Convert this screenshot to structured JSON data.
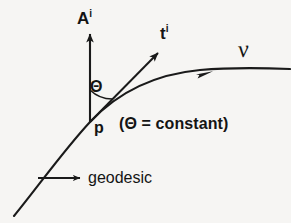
{
  "diagram": {
    "background_color": "#f6f5f3",
    "stroke_color": "#1a1a1a",
    "labels": {
      "acceleration_vector": "A",
      "acceleration_vector_index": "i",
      "tangent_vector": "t",
      "tangent_vector_index": "i",
      "angle": "Θ",
      "point": "p",
      "angle_condition": "(Θ = constant)",
      "curve": "ᴠ",
      "geodesic": "geodesic"
    },
    "elements": [
      {
        "name": "geodesic-curve",
        "type": "curve",
        "description": "concave-down curve passing through p"
      },
      {
        "name": "acceleration-vector-arrow",
        "type": "arrow",
        "direction": "up",
        "from": "p"
      },
      {
        "name": "tangent-vector-arrow",
        "type": "arrow",
        "direction": "upper-right",
        "from": "p"
      },
      {
        "name": "angle-arc",
        "type": "arc",
        "between": [
          "acceleration-vector-arrow",
          "tangent-vector-arrow"
        ]
      },
      {
        "name": "curve-direction-arrowhead",
        "type": "arrowhead",
        "on": "geodesic-curve"
      },
      {
        "name": "geodesic-pointer-arrow",
        "type": "arrow",
        "direction": "right",
        "points_to": "geodesic-label"
      }
    ]
  }
}
